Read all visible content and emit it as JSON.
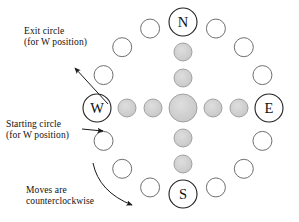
{
  "diagram": {
    "colors": {
      "stroke": "#6f6f6f",
      "cardinal_stroke": "#222222",
      "fill_gray": "#cfcfcf",
      "fill_gray_dark": "#bdbdbd",
      "background": "#ffffff",
      "text": "#111111",
      "arrow": "#1a1a1a"
    },
    "ring": {
      "center_x": 183,
      "center_y": 108,
      "radius": 86,
      "count": 16,
      "small_radius": 9.5,
      "cardinal_radius": 14
    },
    "cardinals": [
      {
        "label": "N",
        "index": 0,
        "angle_deg": 90
      },
      {
        "label": "E",
        "index": 4,
        "angle_deg": 0
      },
      {
        "label": "S",
        "index": 8,
        "angle_deg": 270
      },
      {
        "label": "W",
        "index": 12,
        "angle_deg": 180
      }
    ],
    "inner_cross": {
      "center_radius": 14,
      "arm_radius": 9,
      "horizontal_offsets": [
        -56,
        -30,
        30,
        56
      ],
      "vertical_offsets": [
        -56,
        -30,
        30,
        56
      ]
    },
    "annotations": [
      {
        "id": "exit",
        "line1": "Exit circle",
        "line2": "(for W position)",
        "arrow": "straight",
        "points_to": "circle above W on the ring"
      },
      {
        "id": "start",
        "line1": "Starting circle",
        "line2": "(for W position)",
        "arrow": "straight",
        "points_to": "circle below W on the ring"
      },
      {
        "id": "moves",
        "line1": "Moves are",
        "line2": "counterclockwise",
        "arrow": "curved",
        "points_to": "lower-left arc of the ring"
      }
    ]
  }
}
